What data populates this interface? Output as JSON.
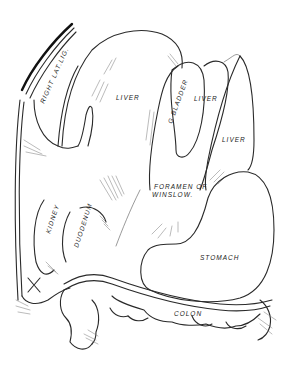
{
  "figure": {
    "type": "anatomical line drawing",
    "labels": {
      "right_lat_lig": "RIGHT LAT.LIG.",
      "liver_main": "LIVER",
      "gall_bladder": "G BLADDER",
      "liver_middle": "LIVER",
      "liver_right": "LIVER",
      "foramen_line1": "FORAMEN OF",
      "foramen_line2": "WINSLOW.",
      "kidney": "KIDNEY",
      "duodenum": "DUODENUM",
      "stomach": "STOMACH",
      "colon": "COLON",
      "marker": "X"
    },
    "colors": {
      "background": "#ffffff",
      "ink": "#2a2a2a"
    }
  }
}
